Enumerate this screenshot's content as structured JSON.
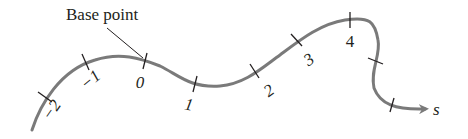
{
  "diagram": {
    "type": "arc-length-parametrization",
    "base_label": "Base point",
    "axis_label": "s",
    "curve_color": "#7a7a7a",
    "tick_color": "#231f20",
    "ticks": [
      {
        "label": "−2"
      },
      {
        "label": "−1"
      },
      {
        "label": "0"
      },
      {
        "label": "1"
      },
      {
        "label": "2"
      },
      {
        "label": "3"
      },
      {
        "label": "4"
      },
      {
        "label": ""
      },
      {
        "label": ""
      }
    ]
  }
}
